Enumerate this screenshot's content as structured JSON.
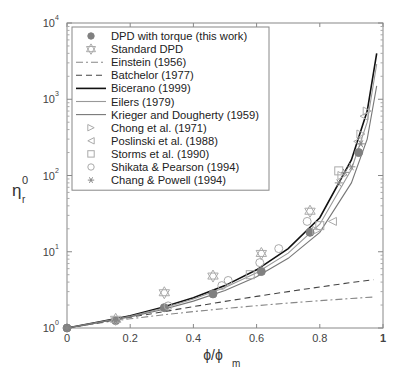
{
  "chart_data": {
    "type": "line",
    "title": "",
    "xlabel": "ϕ/ϕm",
    "xlabel_main": "ϕ/ϕ",
    "xlabel_sub": "m",
    "ylabel": "ηr0",
    "ylabel_main": "η",
    "ylabel_sup": "0",
    "ylabel_sub": "r",
    "xlim": [
      0,
      1
    ],
    "ylim": [
      1,
      10000
    ],
    "yscale": "log",
    "grid": false,
    "legend_position": "upper-left",
    "xticks": [
      0,
      0.2,
      0.4,
      0.6,
      0.8,
      1
    ],
    "xtick_labels": [
      "0",
      "0.2",
      "0.4",
      "0.6",
      "0.8",
      "1"
    ],
    "yticks": [
      1,
      10,
      100,
      1000,
      10000
    ],
    "ytick_labels": [
      {
        "base": "10",
        "exp": "0"
      },
      {
        "base": "10",
        "exp": "1"
      },
      {
        "base": "10",
        "exp": "2"
      },
      {
        "base": "10",
        "exp": "3"
      },
      {
        "base": "10",
        "exp": "4"
      }
    ],
    "legend": [
      "DPD with torque (this work)",
      "Standard DPD",
      "Einstein (1956)",
      "Batchelor (1977)",
      "Bicerano (1999)",
      "Eilers (1979)",
      "Krieger and Dougherty (1959)",
      "Chong et  al. (1971)",
      "Poslinski et  al. (1988)",
      "Storms et  al. (1990)",
      "Shikata & Pearson (1994)",
      "Chang & Powell (1994)"
    ],
    "series": [
      {
        "name": "DPD with torque (this work)",
        "kind": "markers",
        "marker": "filled-circle",
        "color": "#808080",
        "x": [
          0.0,
          0.154,
          0.308,
          0.462,
          0.615,
          0.769,
          0.923
        ],
        "y": [
          1.0,
          1.25,
          1.85,
          2.8,
          5.5,
          18,
          200
        ]
      },
      {
        "name": "Standard DPD",
        "kind": "markers",
        "marker": "hexagram-open",
        "color": "#aaaaaa",
        "x": [
          0.154,
          0.308,
          0.462,
          0.615,
          0.769
        ],
        "y": [
          1.3,
          2.9,
          4.8,
          9.5,
          34
        ]
      },
      {
        "name": "Einstein (1956)",
        "kind": "line",
        "style": "dashdot",
        "color": "#888888",
        "x": [
          0,
          0.1,
          0.2,
          0.3,
          0.4,
          0.5,
          0.6,
          0.7,
          0.8,
          0.9,
          0.97
        ],
        "y": [
          1.0,
          1.16,
          1.32,
          1.48,
          1.64,
          1.8,
          1.96,
          2.12,
          2.28,
          2.44,
          2.55
        ]
      },
      {
        "name": "Batchelor (1977)",
        "kind": "line",
        "style": "dashed",
        "color": "#444444",
        "x": [
          0,
          0.1,
          0.2,
          0.3,
          0.4,
          0.5,
          0.6,
          0.7,
          0.8,
          0.9,
          0.97
        ],
        "y": [
          1.0,
          1.17,
          1.38,
          1.62,
          1.91,
          2.23,
          2.6,
          3.0,
          3.45,
          3.95,
          4.3
        ]
      },
      {
        "name": "Bicerano (1999)",
        "kind": "line",
        "style": "solid",
        "color": "#111111",
        "x": [
          0,
          0.1,
          0.2,
          0.3,
          0.4,
          0.5,
          0.6,
          0.7,
          0.8,
          0.9,
          0.95,
          0.98
        ],
        "y": [
          1.0,
          1.2,
          1.45,
          1.85,
          2.5,
          3.6,
          5.8,
          11,
          28,
          160,
          700,
          4000
        ]
      },
      {
        "name": "Eilers (1979)",
        "kind": "line",
        "style": "solid",
        "color": "#999999",
        "x": [
          0,
          0.1,
          0.2,
          0.3,
          0.4,
          0.5,
          0.6,
          0.7,
          0.8,
          0.9,
          0.95,
          0.98
        ],
        "y": [
          1.0,
          1.19,
          1.43,
          1.8,
          2.4,
          3.4,
          5.3,
          9.6,
          23,
          120,
          500,
          2900
        ]
      },
      {
        "name": "Krieger and Dougherty (1959)",
        "kind": "line",
        "style": "solid",
        "color": "#777777",
        "x": [
          0,
          0.1,
          0.2,
          0.3,
          0.4,
          0.5,
          0.6,
          0.7,
          0.8,
          0.9,
          0.95,
          0.98
        ],
        "y": [
          1.0,
          1.18,
          1.4,
          1.74,
          2.25,
          3.1,
          4.7,
          8.2,
          18,
          80,
          300,
          1500
        ]
      },
      {
        "name": "Chong et  al. (1971)",
        "kind": "markers",
        "marker": "triangle-right-open",
        "color": "#aaaaaa",
        "x": [
          0.79,
          0.87,
          0.93,
          0.95
        ],
        "y": [
          19,
          100,
          350,
          700
        ]
      },
      {
        "name": "Poslinski et  al. (1988)",
        "kind": "markers",
        "marker": "triangle-left-open",
        "color": "#aaaaaa",
        "x": [
          0.84,
          0.92,
          0.94
        ],
        "y": [
          25,
          280,
          600
        ]
      },
      {
        "name": "Storms et  al. (1990)",
        "kind": "markers",
        "marker": "square-open",
        "color": "#aaaaaa",
        "x": [
          0.58,
          0.8,
          0.86
        ],
        "y": [
          5.0,
          22,
          115
        ]
      },
      {
        "name": "Shikata & Pearson (1994)",
        "kind": "markers",
        "marker": "circle-open",
        "color": "#aaaaaa",
        "x": [
          0.32,
          0.49,
          0.51,
          0.61,
          0.67,
          0.76
        ],
        "y": [
          1.95,
          3.6,
          4.2,
          7.2,
          11,
          25
        ]
      },
      {
        "name": "Chang & Powell (1994)",
        "kind": "markers",
        "marker": "asterisk",
        "color": "#888888",
        "x": [
          0.0,
          0.154,
          0.86,
          0.88,
          0.9,
          0.93
        ],
        "y": [
          1.0,
          1.25,
          80,
          110,
          130,
          260
        ]
      }
    ]
  }
}
